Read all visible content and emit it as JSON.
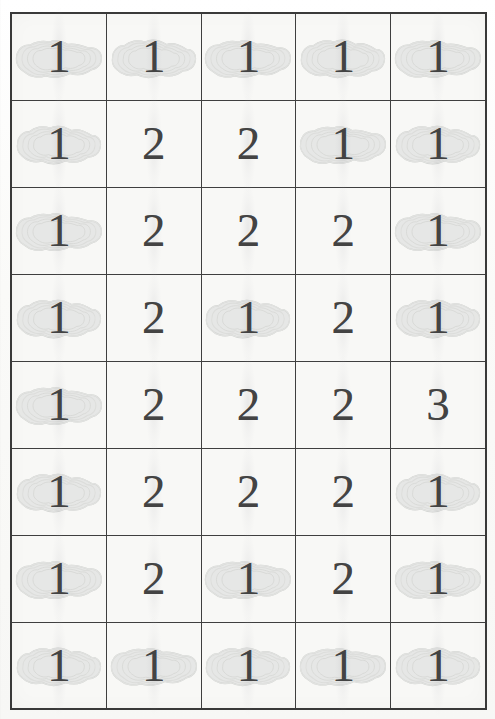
{
  "document": {
    "type": "scanned-table",
    "title": "Scanned numeric grid",
    "rows": 8,
    "columns": 5,
    "colors": {
      "page_background": "#fbfbfa",
      "cell_background": "#f8f8f6",
      "grid_line": "#3f3f3f",
      "digit": "#434343",
      "smudge": "#b9bcb9"
    },
    "artifacts": {
      "smudge_name": "grey-contour-smudge",
      "streak_name": "vertical-scan-streak"
    }
  },
  "table": {
    "cells": [
      [
        {
          "value": "1",
          "smudge": true
        },
        {
          "value": "1",
          "smudge": true
        },
        {
          "value": "1",
          "smudge": true
        },
        {
          "value": "1",
          "smudge": true
        },
        {
          "value": "1",
          "smudge": true
        }
      ],
      [
        {
          "value": "1",
          "smudge": true
        },
        {
          "value": "2",
          "smudge": false
        },
        {
          "value": "2",
          "smudge": false
        },
        {
          "value": "1",
          "smudge": true
        },
        {
          "value": "1",
          "smudge": true
        }
      ],
      [
        {
          "value": "1",
          "smudge": true
        },
        {
          "value": "2",
          "smudge": false
        },
        {
          "value": "2",
          "smudge": false
        },
        {
          "value": "2",
          "smudge": false
        },
        {
          "value": "1",
          "smudge": true
        }
      ],
      [
        {
          "value": "1",
          "smudge": true
        },
        {
          "value": "2",
          "smudge": false
        },
        {
          "value": "1",
          "smudge": true
        },
        {
          "value": "2",
          "smudge": false
        },
        {
          "value": "1",
          "smudge": true
        }
      ],
      [
        {
          "value": "1",
          "smudge": true
        },
        {
          "value": "2",
          "smudge": false
        },
        {
          "value": "2",
          "smudge": false
        },
        {
          "value": "2",
          "smudge": false
        },
        {
          "value": "3",
          "smudge": false
        }
      ],
      [
        {
          "value": "1",
          "smudge": true
        },
        {
          "value": "2",
          "smudge": false
        },
        {
          "value": "2",
          "smudge": false
        },
        {
          "value": "2",
          "smudge": false
        },
        {
          "value": "1",
          "smudge": true
        }
      ],
      [
        {
          "value": "1",
          "smudge": true
        },
        {
          "value": "2",
          "smudge": false
        },
        {
          "value": "1",
          "smudge": true
        },
        {
          "value": "2",
          "smudge": false
        },
        {
          "value": "1",
          "smudge": true
        }
      ],
      [
        {
          "value": "1",
          "smudge": true
        },
        {
          "value": "1",
          "smudge": true
        },
        {
          "value": "1",
          "smudge": true
        },
        {
          "value": "1",
          "smudge": true
        },
        {
          "value": "1",
          "smudge": true
        }
      ]
    ]
  }
}
